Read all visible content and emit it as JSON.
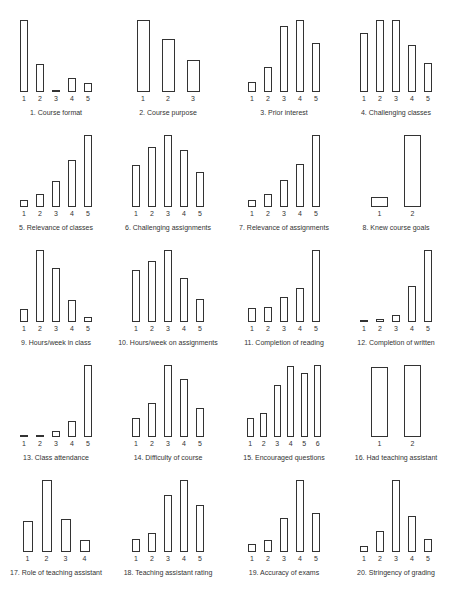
{
  "chart_data": [
    {
      "type": "bar",
      "title": "1. Course format",
      "categories": [
        "1",
        "2",
        "3",
        "4",
        "5"
      ],
      "values": [
        72,
        28,
        2,
        14,
        9
      ],
      "ylim": [
        0,
        72
      ],
      "grid": false
    },
    {
      "type": "bar",
      "title": "2. Course purpose",
      "categories": [
        "1",
        "2",
        "3"
      ],
      "values": [
        72,
        53,
        32
      ],
      "ylim": [
        0,
        72
      ],
      "grid": false
    },
    {
      "type": "bar",
      "title": "3. Prior interest",
      "categories": [
        "1",
        "2",
        "3",
        "4",
        "5"
      ],
      "values": [
        10,
        25,
        66,
        72,
        49
      ],
      "ylim": [
        0,
        72
      ],
      "grid": false
    },
    {
      "type": "bar",
      "title": "4. Challenging classes",
      "categories": [
        "1",
        "2",
        "3",
        "4",
        "5"
      ],
      "values": [
        59,
        72,
        72,
        47,
        29
      ],
      "ylim": [
        0,
        72
      ],
      "grid": false
    },
    {
      "type": "bar",
      "title": "5. Relevance of classes",
      "categories": [
        "1",
        "2",
        "3",
        "4",
        "5"
      ],
      "values": [
        7,
        13,
        26,
        47,
        72
      ],
      "ylim": [
        0,
        72
      ],
      "grid": false
    },
    {
      "type": "bar",
      "title": "6. Challenging assignments",
      "categories": [
        "1",
        "2",
        "3",
        "4",
        "5"
      ],
      "values": [
        42,
        60,
        72,
        57,
        35
      ],
      "ylim": [
        0,
        72
      ],
      "grid": false
    },
    {
      "type": "bar",
      "title": "7. Relevance of assignments",
      "categories": [
        "1",
        "2",
        "3",
        "4",
        "5"
      ],
      "values": [
        7,
        13,
        27,
        43,
        72
      ],
      "ylim": [
        0,
        72
      ],
      "grid": false
    },
    {
      "type": "bar",
      "title": "8. Knew course goals",
      "categories": [
        "1",
        "2"
      ],
      "values": [
        10,
        72
      ],
      "ylim": [
        0,
        72
      ],
      "grid": false
    },
    {
      "type": "bar",
      "title": "9. Hours/week in class",
      "categories": [
        "1",
        "2",
        "3",
        "4",
        "5"
      ],
      "values": [
        13,
        72,
        54,
        22,
        5
      ],
      "ylim": [
        0,
        72
      ],
      "grid": false
    },
    {
      "type": "bar",
      "title": "10. Hours/week on assignments",
      "categories": [
        "1",
        "2",
        "3",
        "4",
        "5"
      ],
      "values": [
        52,
        61,
        72,
        44,
        23
      ],
      "ylim": [
        0,
        72
      ],
      "grid": false
    },
    {
      "type": "bar",
      "title": "11. Completion of reading",
      "categories": [
        "1",
        "2",
        "3",
        "4",
        "5"
      ],
      "values": [
        14,
        15,
        25,
        34,
        72
      ],
      "ylim": [
        0,
        72
      ],
      "grid": false
    },
    {
      "type": "bar",
      "title": "12. Completion of written",
      "categories": [
        "1",
        "2",
        "3",
        "4",
        "5"
      ],
      "values": [
        1,
        3,
        7,
        36,
        72
      ],
      "ylim": [
        0,
        72
      ],
      "grid": false
    },
    {
      "type": "bar",
      "title": "13. Class attendance",
      "categories": [
        "1",
        "2",
        "3",
        "4",
        "5"
      ],
      "values": [
        2,
        2,
        6,
        16,
        72
      ],
      "ylim": [
        0,
        72
      ],
      "grid": false
    },
    {
      "type": "bar",
      "title": "14. Difficulty of course",
      "categories": [
        "1",
        "2",
        "3",
        "4",
        "5"
      ],
      "values": [
        19,
        34,
        72,
        58,
        29
      ],
      "ylim": [
        0,
        72
      ],
      "grid": false
    },
    {
      "type": "bar",
      "title": "15. Encouraged questions",
      "categories": [
        "1",
        "2",
        "3",
        "4",
        "5",
        "6"
      ],
      "values": [
        19,
        24,
        52,
        71,
        64,
        72
      ],
      "ylim": [
        0,
        72
      ],
      "grid": false
    },
    {
      "type": "bar",
      "title": "16. Had teaching assistant",
      "categories": [
        "1",
        "2"
      ],
      "values": [
        70,
        72
      ],
      "ylim": [
        0,
        72
      ],
      "grid": false
    },
    {
      "type": "bar",
      "title": "17. Role of teaching assistant",
      "categories": [
        "1",
        "2",
        "3",
        "4"
      ],
      "values": [
        31,
        72,
        33,
        12
      ],
      "ylim": [
        0,
        72
      ],
      "grid": false
    },
    {
      "type": "bar",
      "title": "18. Teaching assistant rating",
      "categories": [
        "1",
        "2",
        "3",
        "4",
        "5"
      ],
      "values": [
        13,
        19,
        57,
        72,
        47
      ],
      "ylim": [
        0,
        72
      ],
      "grid": false
    },
    {
      "type": "bar",
      "title": "19. Accuracy of exams",
      "categories": [
        "1",
        "2",
        "3",
        "4",
        "5"
      ],
      "values": [
        8,
        12,
        34,
        72,
        39
      ],
      "ylim": [
        0,
        72
      ],
      "grid": false
    },
    {
      "type": "bar",
      "title": "20. Stringency of grading",
      "categories": [
        "1",
        "2",
        "3",
        "4",
        "5"
      ],
      "values": [
        6,
        21,
        72,
        36,
        13
      ],
      "ylim": [
        0,
        72
      ],
      "grid": false
    }
  ],
  "layout": {
    "columns_left": [
      0,
      112,
      228,
      340
    ],
    "rows_top": [
      10,
      125,
      240,
      355,
      470
    ],
    "bar_color": "#333333"
  }
}
